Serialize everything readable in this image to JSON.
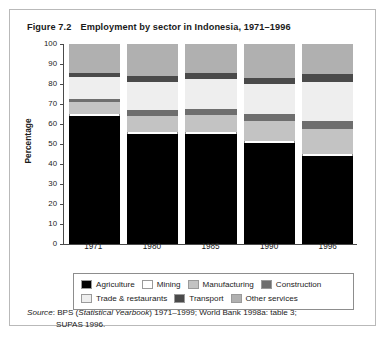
{
  "figure": {
    "number": "Figure 7.2",
    "title": "Employment by sector in Indonesia, 1971–1996"
  },
  "source": {
    "word": "Source",
    "separator": ":",
    "line1_pre": " BPS (",
    "line1_italic": "Statistical Yearbook",
    "line1_post": ") 1971–1999; World Bank 1998a: table 3;",
    "line2": "SUPAS 1996."
  },
  "legend": {
    "rows": [
      [
        {
          "label": "Agriculture",
          "color": "#000000"
        },
        {
          "label": "Mining",
          "color": "#ffffff"
        },
        {
          "label": "Manufacturing",
          "color": "#c3c3c3"
        },
        {
          "label": "Construction",
          "color": "#6e6e6e"
        }
      ],
      [
        {
          "label": "Trade & restaurants",
          "color": "#eeeeee"
        },
        {
          "label": "Transport",
          "color": "#4a4a4a"
        },
        {
          "label": "Other services",
          "color": "#b0b0b0"
        }
      ]
    ]
  },
  "axes": {
    "y_title": "Percentage",
    "y_ticks": [
      "100",
      "90",
      "80",
      "70",
      "60",
      "50",
      "40",
      "30",
      "20",
      "10",
      "0"
    ],
    "x_labels": [
      "1971",
      "1980",
      "1985",
      "1990",
      "1996"
    ]
  },
  "chart_data": {
    "type": "bar",
    "subtype": "stacked-vertical-100",
    "title": "Employment by sector in Indonesia, 1971–1996",
    "xlabel": "",
    "ylabel": "Percentage",
    "ylim": [
      0,
      100
    ],
    "ytick_step": 10,
    "grid": false,
    "legend_position": "below-plot",
    "categories": [
      "1971",
      "1980",
      "1985",
      "1990",
      "1996"
    ],
    "series": [
      {
        "name": "Agriculture",
        "color": "#000000",
        "values": [
          64.0,
          55.0,
          55.0,
          50.5,
          44.0
        ]
      },
      {
        "name": "Mining",
        "color": "#ffffff",
        "values": [
          1.0,
          1.0,
          1.0,
          1.0,
          1.0
        ]
      },
      {
        "name": "Manufacturing",
        "color": "#c3c3c3",
        "values": [
          6.0,
          8.0,
          8.5,
          10.0,
          12.5
        ]
      },
      {
        "name": "Construction",
        "color": "#6e6e6e",
        "values": [
          1.5,
          3.0,
          3.0,
          3.5,
          4.0
        ]
      },
      {
        "name": "Trade & restaurants",
        "color": "#eeeeee",
        "values": [
          11.0,
          14.0,
          15.0,
          15.0,
          19.5
        ]
      },
      {
        "name": "Transport",
        "color": "#4a4a4a",
        "values": [
          2.0,
          3.0,
          3.0,
          3.0,
          4.0
        ]
      },
      {
        "name": "Other services",
        "color": "#b0b0b0",
        "values": [
          14.5,
          16.0,
          14.5,
          17.0,
          15.0
        ]
      }
    ]
  }
}
